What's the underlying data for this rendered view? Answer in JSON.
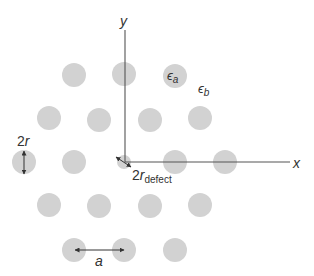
{
  "diagram": {
    "type": "photonic-crystal-lattice-with-defect",
    "colors": {
      "rod": "#d2d2d2",
      "axis": "#555555",
      "arrow": "#333333",
      "text": "#333333",
      "background": "#ffffff"
    },
    "rods": [
      {
        "row": 1,
        "cx": 74,
        "cy": 75,
        "r": 12
      },
      {
        "row": 1,
        "cx": 124,
        "cy": 74,
        "r": 12
      },
      {
        "row": 1,
        "cx": 175,
        "cy": 76,
        "r": 12,
        "label": "epsilon_a"
      },
      {
        "row": 2,
        "cx": 49,
        "cy": 118,
        "r": 12
      },
      {
        "row": 2,
        "cx": 99,
        "cy": 120,
        "r": 12
      },
      {
        "row": 2,
        "cx": 150,
        "cy": 120,
        "r": 12
      },
      {
        "row": 2,
        "cx": 200,
        "cy": 118,
        "r": 12
      },
      {
        "row": 3,
        "cx": 24,
        "cy": 162,
        "r": 12,
        "label": "2r"
      },
      {
        "row": 3,
        "cx": 74,
        "cy": 162,
        "r": 12
      },
      {
        "row": 3,
        "cx": 124,
        "cy": 162,
        "r": 7,
        "defect": true
      },
      {
        "row": 3,
        "cx": 175,
        "cy": 162,
        "r": 12
      },
      {
        "row": 3,
        "cx": 225,
        "cy": 162,
        "r": 12
      },
      {
        "row": 4,
        "cx": 49,
        "cy": 205,
        "r": 12
      },
      {
        "row": 4,
        "cx": 99,
        "cy": 206,
        "r": 12
      },
      {
        "row": 4,
        "cx": 150,
        "cy": 206,
        "r": 12
      },
      {
        "row": 4,
        "cx": 200,
        "cy": 205,
        "r": 12
      },
      {
        "row": 5,
        "cx": 74,
        "cy": 250,
        "r": 12
      },
      {
        "row": 5,
        "cx": 124,
        "cy": 250,
        "r": 12
      },
      {
        "row": 5,
        "cx": 175,
        "cy": 250,
        "r": 12
      }
    ],
    "labels": {
      "y_axis": "y",
      "x_axis": "x",
      "epsilon_a_base": "ϵ",
      "epsilon_a_sub": "a",
      "epsilon_b_base": "ϵ",
      "epsilon_b_sub": "b",
      "radius": "2r",
      "radius_base": "2",
      "radius_var": "r",
      "defect_base": "2",
      "defect_var": "r",
      "defect_sub": "defect",
      "lattice_constant": "a"
    }
  }
}
